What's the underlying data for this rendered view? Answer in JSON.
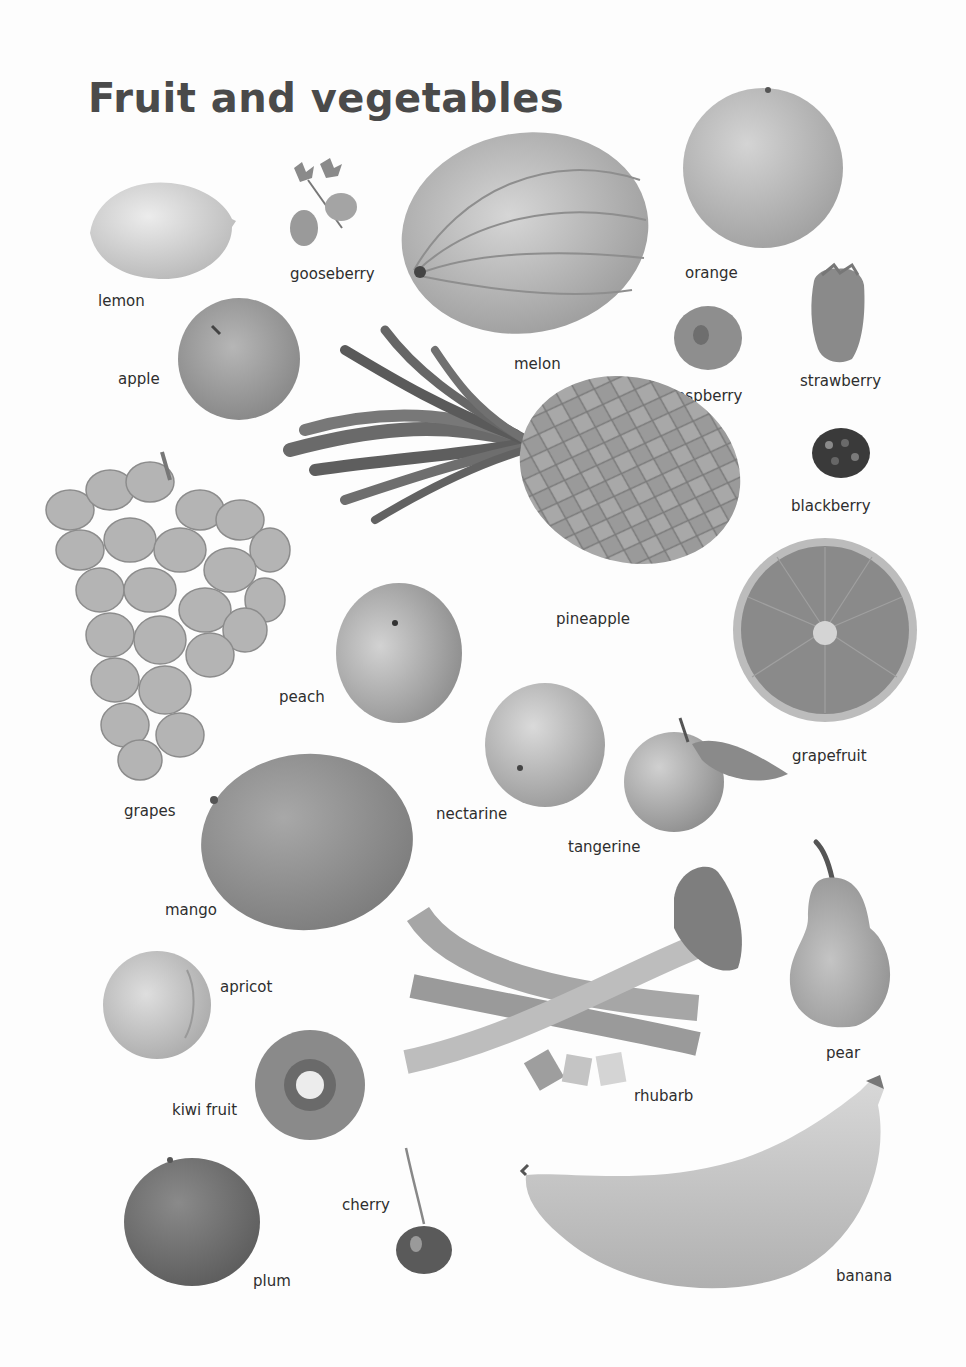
{
  "page": {
    "title": "Fruit and vegetables"
  },
  "items": {
    "lemon": {
      "label": "lemon"
    },
    "gooseberry": {
      "label": "gooseberry"
    },
    "melon": {
      "label": "melon"
    },
    "orange": {
      "label": "orange"
    },
    "apple": {
      "label": "apple"
    },
    "raspberry": {
      "label": "raspberry"
    },
    "strawberry": {
      "label": "strawberry"
    },
    "blackberry": {
      "label": "blackberry"
    },
    "pineapple": {
      "label": "pineapple"
    },
    "grapes": {
      "label": "grapes"
    },
    "peach": {
      "label": "peach"
    },
    "grapefruit": {
      "label": "grapefruit"
    },
    "nectarine": {
      "label": "nectarine"
    },
    "tangerine": {
      "label": "tangerine"
    },
    "mango": {
      "label": "mango"
    },
    "pear": {
      "label": "pear"
    },
    "apricot": {
      "label": "apricot"
    },
    "rhubarb": {
      "label": "rhubarb"
    },
    "kiwi": {
      "label": "kiwi fruit"
    },
    "cherry": {
      "label": "cherry"
    },
    "plum": {
      "label": "plum"
    },
    "banana": {
      "label": "banana"
    }
  }
}
